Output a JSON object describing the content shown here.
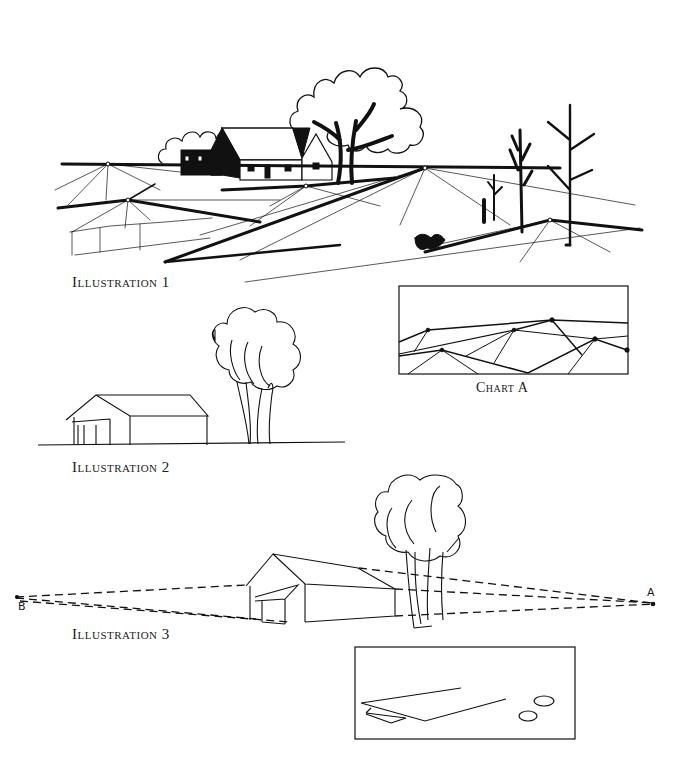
{
  "page": {
    "background": "#ffffff",
    "ink": "#111111"
  },
  "captions": {
    "illustration_1": "Illustration 1",
    "illustration_2": "Illustration 2",
    "illustration_3": "Illustration 3",
    "chart_a": "Chart A"
  },
  "labels": {
    "vanishing_point_a": "A",
    "vanishing_point_b": "B"
  }
}
